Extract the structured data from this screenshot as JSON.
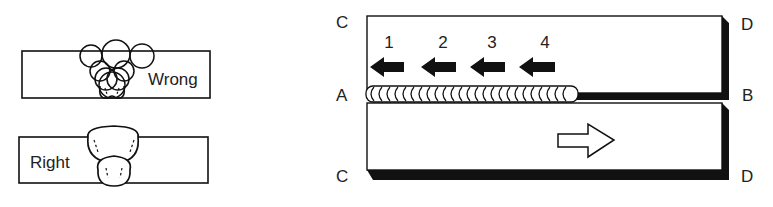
{
  "left_panel": {
    "wrong_label": "Wrong",
    "right_label": "Right"
  },
  "right_panel": {
    "corner_labels": {
      "top_left": "C",
      "top_right": "D",
      "mid_left": "A",
      "mid_right": "B",
      "bottom_left": "C",
      "bottom_right": "D"
    },
    "sequence_numbers": [
      "1",
      "2",
      "3",
      "4"
    ],
    "arrows": {
      "welding_direction": "left-arrow-filled",
      "plate_movement": "right-arrow-hollow"
    }
  },
  "colors": {
    "ink": "#111111",
    "background": "#ffffff"
  }
}
